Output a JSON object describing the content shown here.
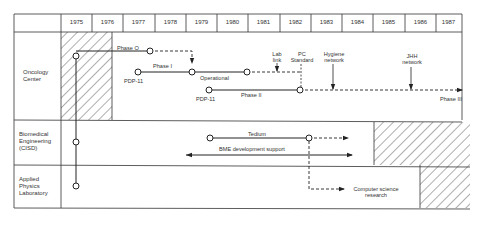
{
  "years": [
    "1975",
    "1976",
    "1977",
    "1978",
    "1979",
    "1980",
    "1981",
    "1982",
    "1983",
    "1984",
    "1985",
    "1986",
    "1987"
  ],
  "rows": [
    {
      "label_lines": [
        "Oncology",
        "Center"
      ]
    },
    {
      "label_lines": [
        "Biomedical",
        "Engineering",
        "(CISD)"
      ]
    },
    {
      "label_lines": [
        "Applied",
        "Physics",
        "Laboratory"
      ]
    }
  ],
  "annotations": {
    "phase0": "Phase O",
    "phase1": "Phase I",
    "pdp11_a": "PDP-11",
    "operational": "Operational",
    "pdp11_b": "PDP-11",
    "phase2": "Phase II",
    "lab_link_1": "Lab",
    "lab_link_2": "link",
    "pc_standard_1": "PC",
    "pc_standard_2": "Standard",
    "hygiene_1": "Hygiene",
    "hygiene_2": "network",
    "jhh_1": "JHH",
    "jhh_2": "network",
    "phase3": "Phase III",
    "tedium": "Tedium",
    "bme_support": "BME development support",
    "cs_research_1": "Computer science",
    "cs_research_2": "research"
  },
  "colors": {
    "line": "#222222",
    "grid": "#333333",
    "background": "#ffffff"
  }
}
